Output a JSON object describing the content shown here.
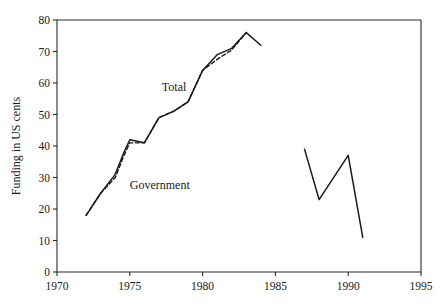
{
  "chart_data": {
    "type": "line",
    "title": "",
    "xlabel": "",
    "ylabel": "Funding in US cents",
    "xlim": [
      1970,
      1995
    ],
    "ylim": [
      0,
      80
    ],
    "xticks": [
      1970,
      1975,
      1980,
      1985,
      1990,
      1995
    ],
    "yticks": [
      0,
      10,
      20,
      30,
      40,
      50,
      60,
      70,
      80
    ],
    "grid": false,
    "legend": "inline-annotations",
    "annotations": [
      {
        "text": "Total",
        "x": 1977.2,
        "y": 57.5
      },
      {
        "text": "Government",
        "x": 1975.0,
        "y": 26.5
      }
    ],
    "series": [
      {
        "name": "Total",
        "style": "solid",
        "x": [
          1972,
          1973,
          1974,
          1974.6,
          1975,
          1976,
          1977,
          1978,
          1979,
          1980,
          1981,
          1982,
          1983,
          1984
        ],
        "values": [
          18,
          25,
          31,
          38,
          42,
          41,
          49,
          51,
          54,
          64,
          69,
          71,
          76,
          72
        ]
      },
      {
        "name": "Government",
        "style": "dashed",
        "x": [
          1972,
          1973,
          1974,
          1974.6,
          1975,
          1976,
          1977,
          1978,
          1979,
          1980,
          1981,
          1982,
          1983
        ],
        "values": [
          18,
          25,
          30,
          37,
          41,
          41,
          49,
          51,
          54,
          64,
          67.5,
          70.5,
          76
        ]
      },
      {
        "name": "Later period",
        "style": "solid",
        "x": [
          1987,
          1988,
          1990,
          1991
        ],
        "values": [
          39,
          23,
          37,
          11
        ]
      }
    ]
  }
}
